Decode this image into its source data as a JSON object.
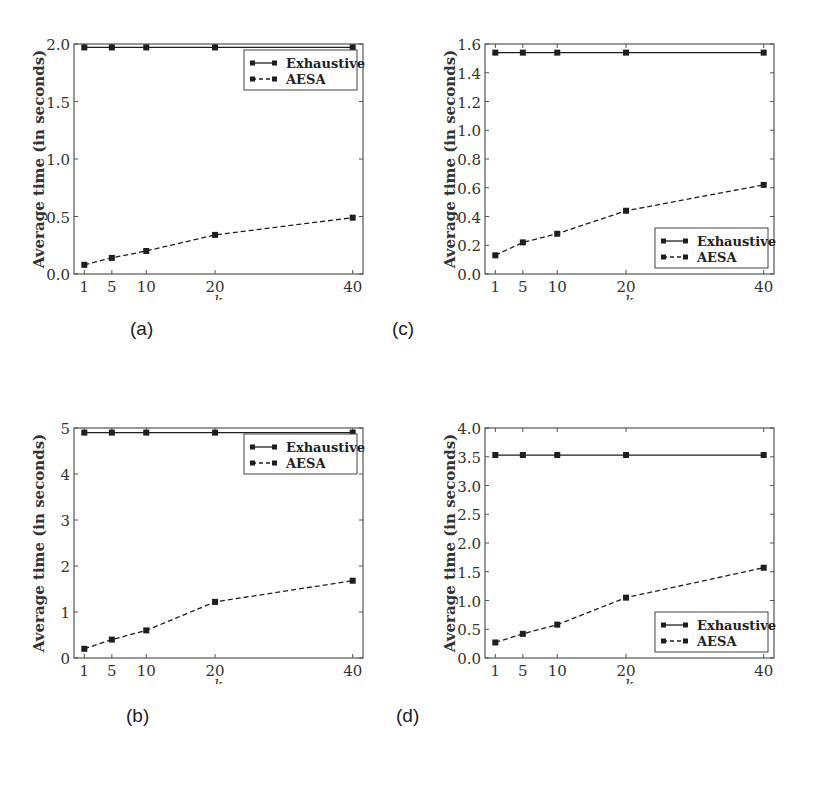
{
  "figure": {
    "subfigure_labels": [
      "(a)",
      "(c)",
      "(b)",
      "(d)"
    ]
  },
  "chart_data": [
    {
      "id": "a",
      "label": "(a)",
      "type": "line",
      "title": "",
      "xlabel": "k",
      "ylabel": "Average time (in seconds)",
      "x": [
        1,
        5,
        10,
        20,
        40
      ],
      "xticks": [
        "1",
        "5",
        "10",
        "20",
        "40"
      ],
      "ylim": [
        0,
        2.0
      ],
      "yticks": [
        "0.0",
        "0.5",
        "1.0",
        "1.5",
        "2.0"
      ],
      "ytick_values": [
        0,
        0.5,
        1.0,
        1.5,
        2.0
      ],
      "legend_position": "upper right",
      "grid": false,
      "series": [
        {
          "name": "Exhaustive",
          "style": "solid",
          "marker": "square",
          "values": [
            1.97,
            1.97,
            1.97,
            1.97,
            1.97
          ]
        },
        {
          "name": "AESA",
          "style": "dashed",
          "marker": "square",
          "values": [
            0.08,
            0.14,
            0.2,
            0.34,
            0.49
          ]
        }
      ]
    },
    {
      "id": "c",
      "label": "(c)",
      "type": "line",
      "title": "",
      "xlabel": "k",
      "ylabel": "Average time (in seconds)",
      "x": [
        1,
        5,
        10,
        20,
        40
      ],
      "xticks": [
        "1",
        "5",
        "10",
        "20",
        "40"
      ],
      "ylim": [
        0,
        1.6
      ],
      "yticks": [
        "0.0",
        "0.2",
        "0.4",
        "0.6",
        "0.8",
        "1.0",
        "1.2",
        "1.4",
        "1.6"
      ],
      "ytick_values": [
        0,
        0.2,
        0.4,
        0.6,
        0.8,
        1.0,
        1.2,
        1.4,
        1.6
      ],
      "legend_position": "lower right",
      "grid": false,
      "series": [
        {
          "name": "Exhaustive",
          "style": "solid",
          "marker": "square",
          "values": [
            1.54,
            1.54,
            1.54,
            1.54,
            1.54
          ]
        },
        {
          "name": "AESA",
          "style": "dashed",
          "marker": "square",
          "values": [
            0.13,
            0.22,
            0.28,
            0.44,
            0.62
          ]
        }
      ]
    },
    {
      "id": "b",
      "label": "(b)",
      "type": "line",
      "title": "",
      "xlabel": "k",
      "ylabel": "Average time (in seconds)",
      "x": [
        1,
        5,
        10,
        20,
        40
      ],
      "xticks": [
        "1",
        "5",
        "10",
        "20",
        "40"
      ],
      "ylim": [
        0,
        5
      ],
      "yticks": [
        "0",
        "1",
        "2",
        "3",
        "4",
        "5"
      ],
      "ytick_values": [
        0,
        1,
        2,
        3,
        4,
        5
      ],
      "legend_position": "upper right",
      "grid": false,
      "series": [
        {
          "name": "Exhaustive",
          "style": "solid",
          "marker": "square",
          "values": [
            4.9,
            4.9,
            4.9,
            4.9,
            4.9
          ]
        },
        {
          "name": "AESA",
          "style": "dashed",
          "marker": "square",
          "values": [
            0.2,
            0.4,
            0.6,
            1.22,
            1.68
          ]
        }
      ]
    },
    {
      "id": "d",
      "label": "(d)",
      "type": "line",
      "title": "",
      "xlabel": "k",
      "ylabel": "Average time (in seconds)",
      "x": [
        1,
        5,
        10,
        20,
        40
      ],
      "xticks": [
        "1",
        "5",
        "10",
        "20",
        "40"
      ],
      "ylim": [
        0,
        4.0
      ],
      "yticks": [
        "0.0",
        "0.5",
        "1.0",
        "1.5",
        "2.0",
        "2.5",
        "3.0",
        "3.5",
        "4.0"
      ],
      "ytick_values": [
        0,
        0.5,
        1.0,
        1.5,
        2.0,
        2.5,
        3.0,
        3.5,
        4.0
      ],
      "legend_position": "lower right",
      "grid": false,
      "series": [
        {
          "name": "Exhaustive",
          "style": "solid",
          "marker": "square",
          "values": [
            3.53,
            3.53,
            3.53,
            3.53,
            3.53
          ]
        },
        {
          "name": "AESA",
          "style": "dashed",
          "marker": "square",
          "values": [
            0.27,
            0.42,
            0.58,
            1.05,
            1.57
          ]
        }
      ]
    }
  ]
}
